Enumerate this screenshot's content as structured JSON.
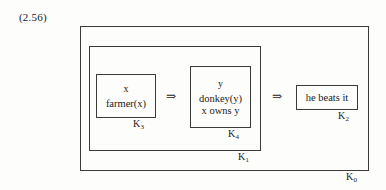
{
  "figure": {
    "equation_number": "(2.56)",
    "type": "drs-box-diagram",
    "line_color": "#3a3a3a",
    "background_color": "#fdfdfc",
    "text_color": "#1a1a1a"
  },
  "boxes": {
    "k0": {
      "label_k": "K",
      "label_sub": "0",
      "referents": "",
      "conditions": []
    },
    "k1": {
      "label_k": "K",
      "label_sub": "1",
      "referents": "",
      "conditions": []
    },
    "k3": {
      "label_k": "K",
      "label_sub": "3",
      "referents": "x",
      "conditions": [
        "farmer(x)"
      ]
    },
    "k4": {
      "label_k": "K",
      "label_sub": "4",
      "referents": "y",
      "conditions": [
        "donkey(y)",
        "x owns y"
      ]
    },
    "k2": {
      "label_k": "K",
      "label_sub": "2",
      "referents": "",
      "conditions": [
        "he beats it"
      ]
    }
  },
  "connectives": {
    "arrow_1": "⇒",
    "arrow_2": "⇒"
  }
}
